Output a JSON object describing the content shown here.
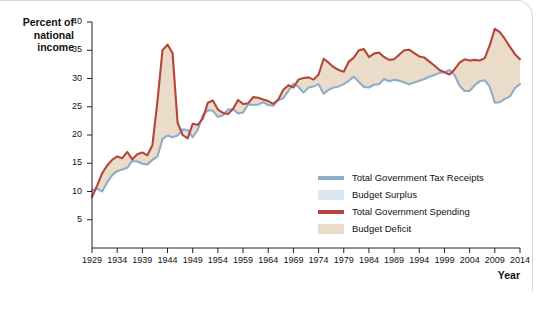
{
  "chart_data": {
    "type": "line",
    "title": "",
    "xlabel": "Year",
    "ylabel": "Percent of\nnational\nincome",
    "xlim": [
      1929,
      2014
    ],
    "ylim": [
      0,
      40
    ],
    "yticks": [
      5,
      10,
      15,
      20,
      25,
      30,
      35,
      40
    ],
    "xticks": [
      1929,
      1934,
      1939,
      1944,
      1949,
      1954,
      1959,
      1964,
      1969,
      1974,
      1979,
      1984,
      1989,
      1994,
      1999,
      2004,
      2009,
      2014
    ],
    "grid": false,
    "legend_position": "inside-bottom-right",
    "legend": [
      {
        "label": "Total Government Tax Receipts",
        "type": "line",
        "color": "#8fadc6"
      },
      {
        "label": "Budget Surplus",
        "type": "area",
        "color": "#dbe7f0"
      },
      {
        "label": "Total Government Spending",
        "type": "line",
        "color": "#b4453a"
      },
      {
        "label": "Budget Deficit",
        "type": "area",
        "color": "#ebdcc9"
      }
    ],
    "x": [
      1929,
      1930,
      1931,
      1932,
      1933,
      1934,
      1935,
      1936,
      1937,
      1938,
      1939,
      1940,
      1941,
      1942,
      1943,
      1944,
      1945,
      1946,
      1947,
      1948,
      1949,
      1950,
      1951,
      1952,
      1953,
      1954,
      1955,
      1956,
      1957,
      1958,
      1959,
      1960,
      1961,
      1962,
      1963,
      1964,
      1965,
      1966,
      1967,
      1968,
      1969,
      1970,
      1971,
      1972,
      1973,
      1974,
      1975,
      1976,
      1977,
      1978,
      1979,
      1980,
      1981,
      1982,
      1983,
      1984,
      1985,
      1986,
      1987,
      1988,
      1989,
      1990,
      1991,
      1992,
      1993,
      1994,
      1995,
      1996,
      1997,
      1998,
      1999,
      2000,
      2001,
      2002,
      2003,
      2004,
      2005,
      2006,
      2007,
      2008,
      2009,
      2010,
      2011,
      2012,
      2013,
      2014
    ],
    "series": [
      {
        "name": "Total Government Tax Receipts",
        "color": "#8fadc6",
        "values": [
          10.2,
          10.5,
          10.0,
          11.6,
          12.9,
          13.6,
          13.9,
          14.2,
          15.4,
          15.3,
          14.9,
          14.8,
          15.6,
          16.2,
          19.3,
          19.9,
          19.6,
          19.9,
          21.0,
          20.9,
          19.6,
          20.9,
          23.5,
          24.4,
          24.3,
          23.2,
          23.5,
          24.5,
          24.6,
          23.8,
          24.0,
          25.4,
          25.3,
          25.4,
          25.8,
          25.3,
          25.2,
          26.2,
          26.5,
          27.8,
          29.1,
          28.5,
          27.5,
          28.4,
          28.6,
          29.0,
          27.3,
          28.0,
          28.4,
          28.6,
          29.0,
          29.6,
          30.3,
          29.4,
          28.5,
          28.4,
          28.9,
          29.0,
          29.9,
          29.5,
          29.8,
          29.6,
          29.3,
          29.0,
          29.3,
          29.6,
          29.9,
          30.3,
          30.6,
          31.0,
          31.1,
          31.5,
          30.6,
          28.7,
          27.8,
          27.8,
          28.8,
          29.5,
          29.7,
          28.5,
          25.7,
          25.8,
          26.4,
          26.8,
          28.3,
          29.0
        ]
      },
      {
        "name": "Total Government Spending",
        "color": "#b4453a",
        "values": [
          9.0,
          11.0,
          13.2,
          14.6,
          15.6,
          16.2,
          15.9,
          17.0,
          15.7,
          16.6,
          16.9,
          16.4,
          18.2,
          26.0,
          35.0,
          36.0,
          34.5,
          22.2,
          20.0,
          19.4,
          22.0,
          21.8,
          22.9,
          25.7,
          26.1,
          24.5,
          23.9,
          23.7,
          24.6,
          26.2,
          25.5,
          25.6,
          26.7,
          26.6,
          26.3,
          26.0,
          25.5,
          26.3,
          28.0,
          28.8,
          28.4,
          29.8,
          30.1,
          30.2,
          29.8,
          30.7,
          33.5,
          32.8,
          32.0,
          31.5,
          31.2,
          33.0,
          33.7,
          35.0,
          35.2,
          33.8,
          34.4,
          34.6,
          33.8,
          33.3,
          33.4,
          34.2,
          35.0,
          35.1,
          34.5,
          33.9,
          33.7,
          33.0,
          32.3,
          31.5,
          31.1,
          30.7,
          31.6,
          32.8,
          33.4,
          33.2,
          33.3,
          33.2,
          33.6,
          35.9,
          38.8,
          38.2,
          37.0,
          35.6,
          34.3,
          33.4
        ]
      }
    ],
    "annotations": [
      {
        "text": "WWII spending peak",
        "year": 1944,
        "value": 36.0
      },
      {
        "text": "Budget surplus years",
        "year": 1999,
        "value": 31.1
      },
      {
        "text": "Great Recession spending peak",
        "year": 2009,
        "value": 38.8
      }
    ]
  },
  "axes": {
    "y_title": "Percent of\nnational\nincome",
    "x_title": "Year"
  }
}
